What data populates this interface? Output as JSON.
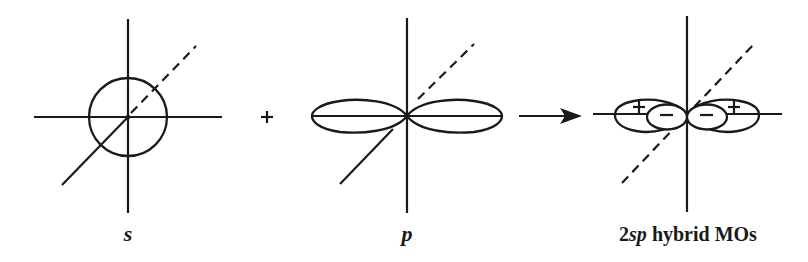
{
  "diagram": {
    "colors": {
      "stroke": "#1a1a1a",
      "background": "#ffffff"
    },
    "panels": [
      {
        "id": "s",
        "label": "s",
        "shape": "sphere",
        "description": "s orbital: circle centered at origin"
      },
      {
        "id": "p",
        "label": "p",
        "shape": "dumbbell",
        "description": "p orbital: two lobes along horizontal axis"
      },
      {
        "id": "hybrid",
        "label_number": "2",
        "label_italic": "sp",
        "label_rest": " hybrid MOs",
        "shape": "two sp hybrids",
        "signs": {
          "large_lobes": "+",
          "small_lobes": "−"
        },
        "description": "two sp hybrid orbitals: large + lobes outward, small − lobes inward"
      }
    ],
    "operators": {
      "plus": "+",
      "arrow": "→"
    }
  }
}
